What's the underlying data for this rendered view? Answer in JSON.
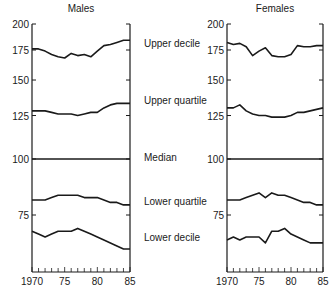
{
  "chart_data": {
    "type": "line",
    "title": "",
    "ylabel": "",
    "xlabel": "",
    "yscale": "log",
    "ylim": [
      55,
      200
    ],
    "yticks": [
      200,
      175,
      150,
      125,
      100,
      75
    ],
    "x": [
      1970,
      1971,
      1972,
      1973,
      1974,
      1975,
      1976,
      1977,
      1978,
      1979,
      1980,
      1981,
      1982,
      1983,
      1984,
      1985
    ],
    "xticks": [
      "1970",
      "75",
      "80",
      "85"
    ],
    "series_labels": [
      "Upper decile",
      "Upper quartile",
      "Median",
      "Lower quartile",
      "Lower decile"
    ],
    "panels": [
      {
        "title": "Males",
        "series": [
          {
            "name": "Upper decile",
            "values": [
              176,
              176,
              174,
              171,
              169,
              168,
              172,
              170,
              171,
              169,
              174,
              179,
              180,
              182,
              184,
              184
            ]
          },
          {
            "name": "Upper quartile",
            "values": [
              128,
              128,
              128,
              127,
              126,
              126,
              126,
              125,
              126,
              127,
              127,
              130,
              132,
              133,
              133,
              133
            ]
          },
          {
            "name": "Median",
            "values": [
              100,
              100,
              100,
              100,
              100,
              100,
              100,
              100,
              100,
              100,
              100,
              100,
              100,
              100,
              100,
              100
            ]
          },
          {
            "name": "Lower quartile",
            "values": [
              81,
              81,
              81,
              82,
              83,
              83,
              83,
              83,
              82,
              82,
              82,
              81,
              80,
              80,
              79,
              79
            ]
          },
          {
            "name": "Lower decile",
            "values": [
              69,
              68,
              67,
              68,
              69,
              69,
              69,
              70,
              69,
              68,
              67,
              66,
              65,
              64,
              63,
              63
            ]
          }
        ]
      },
      {
        "title": "Females",
        "series": [
          {
            "name": "Upper decile",
            "values": [
              182,
              180,
              181,
              178,
              170,
              174,
              177,
              170,
              169,
              169,
              171,
              179,
              178,
              178,
              179,
              179
            ]
          },
          {
            "name": "Upper quartile",
            "values": [
              130,
              130,
              132,
              128,
              126,
              125,
              125,
              124,
              124,
              124,
              125,
              127,
              127,
              128,
              129,
              130
            ]
          },
          {
            "name": "Median",
            "values": [
              100,
              100,
              100,
              100,
              100,
              100,
              100,
              100,
              100,
              100,
              100,
              100,
              100,
              100,
              100,
              100
            ]
          },
          {
            "name": "Lower quartile",
            "values": [
              81,
              81,
              81,
              82,
              83,
              84,
              82,
              84,
              83,
              83,
              82,
              81,
              80,
              80,
              79,
              79
            ]
          },
          {
            "name": "Lower decile",
            "values": [
              66,
              67,
              66,
              67,
              67,
              67,
              65,
              69,
              69,
              70,
              68,
              67,
              66,
              65,
              65,
              65
            ]
          }
        ]
      }
    ],
    "colors": {
      "line": "#1a1a1a",
      "background": "#ffffff"
    }
  }
}
